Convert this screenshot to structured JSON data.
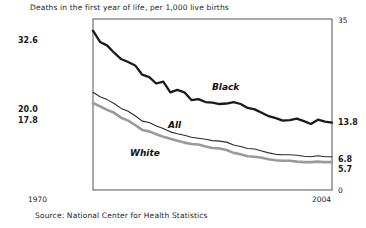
{
  "chart": {
    "title": "Deaths in the first year of life, per 1,000 live births",
    "source": "Source: National Center for Health Statistics",
    "x_start_label": "1970",
    "x_end_label": "2004",
    "left_labels": {
      "black_start": "32.6",
      "all_start": "20.0",
      "white_start": "17.8"
    },
    "right_labels": {
      "axis_top": "35",
      "axis_bottom": "0",
      "black_end": "13.8",
      "all_end": "6.8",
      "white_end": "5.7"
    },
    "series_labels": {
      "black": "Black",
      "all": "All",
      "white": "White"
    },
    "colors": {
      "black_series": "#1a1a1a",
      "all_series": "#2b2b2b",
      "white_series": "#9a9a9a",
      "frame": "#555555"
    }
  },
  "chart_data": {
    "type": "line",
    "title": "Deaths in the first year of life, per 1,000 live births",
    "xlabel": "",
    "ylabel": "Deaths per 1,000 live births",
    "xlim": [
      1970,
      2004
    ],
    "ylim": [
      0,
      35
    ],
    "grid": false,
    "legend": "inline-labels",
    "annotations": [
      "32.6",
      "20.0",
      "17.8",
      "13.8",
      "6.8",
      "5.7"
    ],
    "x": [
      1970,
      1971,
      1972,
      1973,
      1974,
      1975,
      1976,
      1977,
      1978,
      1979,
      1980,
      1981,
      1982,
      1983,
      1984,
      1985,
      1986,
      1987,
      1988,
      1989,
      1990,
      1991,
      1992,
      1993,
      1994,
      1995,
      1996,
      1997,
      1998,
      1999,
      2000,
      2001,
      2002,
      2003,
      2004
    ],
    "series": [
      {
        "name": "Black",
        "values": [
          32.6,
          30.3,
          29.6,
          28.1,
          26.8,
          26.2,
          25.5,
          23.6,
          23.1,
          21.8,
          22.2,
          20.0,
          20.5,
          20.0,
          18.4,
          18.6,
          18.0,
          17.9,
          17.6,
          17.7,
          18.0,
          17.6,
          16.8,
          16.5,
          15.8,
          15.1,
          14.7,
          14.2,
          14.3,
          14.6,
          14.1,
          13.5,
          14.4,
          14.0,
          13.8
        ]
      },
      {
        "name": "All",
        "values": [
          20.0,
          19.1,
          18.5,
          17.7,
          16.7,
          16.1,
          15.2,
          14.1,
          13.8,
          13.1,
          12.6,
          11.9,
          11.5,
          11.2,
          10.8,
          10.6,
          10.4,
          10.1,
          10.0,
          9.8,
          9.2,
          8.9,
          8.5,
          8.4,
          8.0,
          7.6,
          7.3,
          7.2,
          7.2,
          7.1,
          6.9,
          6.8,
          7.0,
          6.8,
          6.8
        ]
      },
      {
        "name": "White",
        "values": [
          17.8,
          17.1,
          16.4,
          15.8,
          14.8,
          14.2,
          13.3,
          12.3,
          12.0,
          11.4,
          10.9,
          10.5,
          10.1,
          9.7,
          9.4,
          9.3,
          8.9,
          8.6,
          8.5,
          8.2,
          7.6,
          7.3,
          6.9,
          6.8,
          6.6,
          6.3,
          6.1,
          6.0,
          6.0,
          5.8,
          5.7,
          5.7,
          5.8,
          5.7,
          5.7
        ]
      }
    ]
  }
}
